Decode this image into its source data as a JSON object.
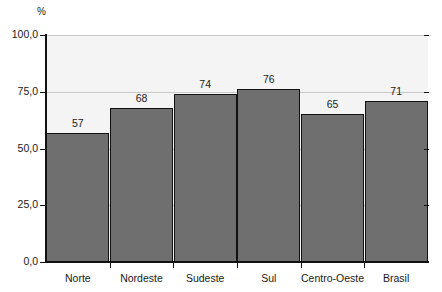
{
  "chart_data": {
    "type": "bar",
    "title": "",
    "subtitle": "",
    "unit_label": "%",
    "xlabel": "",
    "ylabel": "",
    "ylim": [
      0,
      100
    ],
    "y_ticks": [
      "0,0",
      "25,0",
      "50,0",
      "75,0",
      "100,0"
    ],
    "y_tick_values": [
      0,
      25,
      50,
      75,
      100
    ],
    "grid": true,
    "grid_axis": "y",
    "legend": false,
    "categories": [
      "Norte",
      "Nordeste",
      "Sudeste",
      "Sul",
      "Centro-Oeste",
      "Brasil"
    ],
    "values": [
      57,
      68,
      74,
      76,
      65,
      71
    ],
    "value_labels": [
      "57",
      "68",
      "74",
      "76",
      "65",
      "71"
    ],
    "colors": {
      "bar_fill": "#6f6f6f",
      "bar_border": "#111111",
      "plot_background": "#f4f4f4",
      "page_background": "#ffffff",
      "gridline": "#c9c9c9",
      "axis": "#111111",
      "text": "#1a1a1a"
    }
  }
}
